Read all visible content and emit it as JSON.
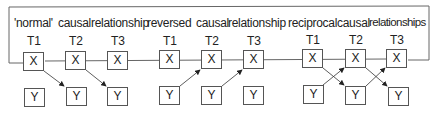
{
  "groups": [
    {
      "title_a": "'normal'",
      "title_b": "causal",
      "title_c": "relationship",
      "times": [
        "T1",
        "T2",
        "T3"
      ],
      "x_label": "X",
      "y_label": "Y",
      "arrows": "X(t) -> Y(t+1)"
    },
    {
      "title_a": "reversed",
      "title_b": "causal",
      "title_c": "relationship",
      "times": [
        "T1",
        "T2",
        "T3"
      ],
      "x_label": "X",
      "y_label": "Y",
      "arrows": "Y(t) -> X(t+1)"
    },
    {
      "title_a": "reciprocal",
      "title_b": "causal",
      "title_c": "relationships",
      "times": [
        "T1",
        "T2",
        "T3"
      ],
      "x_label": "X",
      "y_label": "Y",
      "arrows": "X(t) -> Y(t+1) and Y(t) -> X(t+1)"
    }
  ],
  "colors": {
    "line": "#555555",
    "text": "#222222",
    "background": "#ffffff"
  }
}
